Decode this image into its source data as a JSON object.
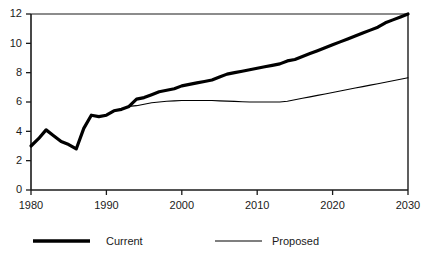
{
  "chart_data": {
    "type": "line",
    "title": "",
    "xlabel": "",
    "ylabel": "",
    "xlim": [
      1980,
      2030
    ],
    "ylim": [
      0,
      12
    ],
    "grid": false,
    "legend_position": "bottom",
    "x_ticks": [
      1980,
      1990,
      2000,
      2010,
      2020,
      2030
    ],
    "y_ticks": [
      0,
      2,
      4,
      6,
      8,
      10,
      12
    ],
    "x_tick_labels": [
      "1980",
      "1990",
      "2000",
      "2010",
      "2020",
      "2030"
    ],
    "y_tick_labels": [
      "0",
      "2",
      "4",
      "6",
      "8",
      "10",
      "12"
    ],
    "series": [
      {
        "name": "Current",
        "style": "bold",
        "color": "#000000",
        "line_width": 3.2,
        "x": [
          1980,
          1981,
          1982,
          1983,
          1984,
          1985,
          1986,
          1987,
          1988,
          1989,
          1990,
          1991,
          1992,
          1993,
          1994,
          1995,
          1996,
          1997,
          1998,
          1999,
          2000,
          2001,
          2002,
          2003,
          2004,
          2005,
          2006,
          2007,
          2008,
          2009,
          2010,
          2011,
          2012,
          2013,
          2014,
          2015,
          2016,
          2017,
          2018,
          2019,
          2020,
          2021,
          2022,
          2023,
          2024,
          2025,
          2026,
          2027,
          2028,
          2029,
          2030
        ],
        "values": [
          3.0,
          3.5,
          4.1,
          3.7,
          3.3,
          3.1,
          2.8,
          4.2,
          5.1,
          5.0,
          5.1,
          5.4,
          5.5,
          5.7,
          6.2,
          6.3,
          6.5,
          6.7,
          6.8,
          6.9,
          7.1,
          7.2,
          7.3,
          7.4,
          7.5,
          7.7,
          7.9,
          8.0,
          8.1,
          8.2,
          8.3,
          8.4,
          8.5,
          8.6,
          8.8,
          8.9,
          9.1,
          9.3,
          9.5,
          9.7,
          9.9,
          10.1,
          10.3,
          10.5,
          10.7,
          10.9,
          11.1,
          11.4,
          11.6,
          11.8,
          12.0
        ]
      },
      {
        "name": "Proposed",
        "style": "thin",
        "color": "#000000",
        "line_width": 1.1,
        "x": [
          1980,
          1981,
          1982,
          1983,
          1984,
          1985,
          1986,
          1987,
          1988,
          1989,
          1990,
          1991,
          1992,
          1993,
          1994,
          1995,
          1996,
          1997,
          1998,
          1999,
          2000,
          2001,
          2002,
          2003,
          2004,
          2005,
          2006,
          2007,
          2008,
          2009,
          2010,
          2011,
          2012,
          2013,
          2014,
          2015,
          2016,
          2017,
          2018,
          2019,
          2020,
          2021,
          2022,
          2023,
          2024,
          2025,
          2026,
          2027,
          2028,
          2029,
          2030
        ],
        "values": [
          3.0,
          3.5,
          4.1,
          3.7,
          3.3,
          3.1,
          2.8,
          4.2,
          5.1,
          5.0,
          5.1,
          5.4,
          5.5,
          5.7,
          5.75,
          5.85,
          5.95,
          6.0,
          6.05,
          6.08,
          6.1,
          6.1,
          6.1,
          6.1,
          6.1,
          6.08,
          6.06,
          6.04,
          6.02,
          6.0,
          6.0,
          6.0,
          6.0,
          6.0,
          6.05,
          6.15,
          6.25,
          6.35,
          6.45,
          6.55,
          6.65,
          6.75,
          6.85,
          6.95,
          7.05,
          7.15,
          7.25,
          7.35,
          7.45,
          7.55,
          7.65
        ]
      }
    ],
    "legend": [
      {
        "label": "Current",
        "style": "bold"
      },
      {
        "label": "Proposed",
        "style": "thin"
      }
    ],
    "colors": {
      "axis": "#1a1a1a",
      "series_current": "#000000",
      "series_proposed": "#000000",
      "background": "#ffffff"
    }
  }
}
